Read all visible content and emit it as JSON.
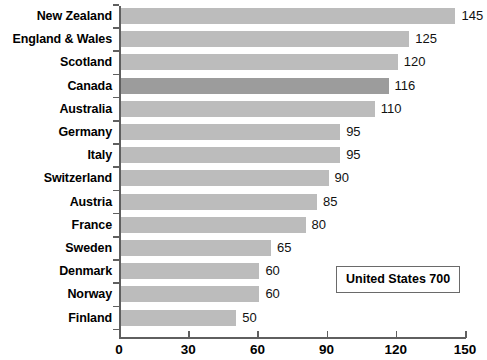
{
  "chart_data": {
    "type": "bar",
    "orientation": "horizontal",
    "title": "",
    "xlabel": "",
    "ylabel": "",
    "xlim": [
      0,
      150
    ],
    "xticks": [
      0,
      30,
      60,
      90,
      120,
      150
    ],
    "grid": false,
    "legend": false,
    "categories": [
      "New Zealand",
      "England & Wales",
      "Scotland",
      "Canada",
      "Australia",
      "Germany",
      "Italy",
      "Switzerland",
      "Austria",
      "France",
      "Sweden",
      "Denmark",
      "Norway",
      "Finland"
    ],
    "values": [
      145,
      125,
      120,
      116,
      110,
      95,
      95,
      90,
      85,
      80,
      65,
      60,
      60,
      50
    ],
    "highlight_category": "Canada",
    "bar_color": "#bcbcbc",
    "highlight_color": "#9c9c9c",
    "axis_color": "#5f5f5f"
  },
  "annotation": {
    "text": "United States 700"
  },
  "title_remnant": {
    "text": ""
  }
}
